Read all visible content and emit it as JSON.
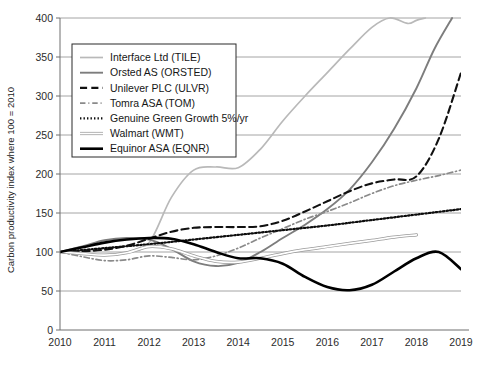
{
  "chart_data": {
    "type": "line",
    "title": "",
    "xlabel": "",
    "ylabel": "Carbon productivity index where 100 = 2010",
    "xlim": [
      2010,
      2019
    ],
    "ylim": [
      0,
      400
    ],
    "yticks": [
      0,
      50,
      100,
      150,
      200,
      250,
      300,
      350,
      400
    ],
    "xticks": [
      2010,
      2011,
      2012,
      2013,
      2014,
      2015,
      2016,
      2017,
      2018,
      2019
    ],
    "grid": true,
    "legend_position": "upper-left",
    "x": [
      2010,
      2011,
      2012,
      2013,
      2014,
      2015,
      2016,
      2017,
      2018,
      2019
    ],
    "series": [
      {
        "name": "Interface Ltd (TILE)",
        "color": "#b9b9b9",
        "style": "solid",
        "width": 1.7,
        "x": [
          2010,
          2010.5,
          2011,
          2011.5,
          2012,
          2012.5,
          2013,
          2013.5,
          2014,
          2014.5,
          2015,
          2015.5,
          2016,
          2016.5,
          2017,
          2017.4,
          2017.8,
          2018,
          2018.2
        ],
        "values": [
          100,
          98,
          96,
          99,
          112,
          170,
          205,
          209,
          208,
          232,
          268,
          300,
          330,
          360,
          388,
          400,
          393,
          397,
          400
        ]
      },
      {
        "name": "Orsted AS (ORSTED)",
        "color": "#7d7d7d",
        "style": "solid",
        "width": 1.9,
        "x": [
          2010,
          2010.5,
          2011,
          2011.5,
          2012,
          2012.5,
          2013,
          2013.5,
          2014,
          2014.5,
          2015,
          2015.5,
          2016,
          2016.5,
          2017,
          2017.5,
          2018,
          2018.4,
          2018.8
        ],
        "values": [
          100,
          107,
          115,
          118,
          116,
          104,
          88,
          82,
          86,
          100,
          118,
          135,
          155,
          180,
          215,
          258,
          310,
          360,
          400
        ]
      },
      {
        "name": "Unilever PLC (ULVR)",
        "color": "#111111",
        "style": "dashed",
        "width": 2.1,
        "x": [
          2010,
          2010.5,
          2011,
          2011.5,
          2012,
          2012.5,
          2013,
          2013.5,
          2014,
          2014.5,
          2015,
          2015.5,
          2016,
          2016.5,
          2017,
          2017.5,
          2018,
          2018.5,
          2019
        ],
        "values": [
          100,
          101,
          103,
          108,
          117,
          126,
          131,
          132,
          132,
          133,
          140,
          152,
          165,
          178,
          188,
          193,
          197,
          245,
          330
        ]
      },
      {
        "name": "Tomra ASA (TOM)",
        "color": "#8a8a8a",
        "style": "dashdot",
        "width": 1.7,
        "x": [
          2010,
          2010.5,
          2011,
          2011.5,
          2012,
          2012.5,
          2013,
          2013.5,
          2014,
          2014.5,
          2015,
          2015.5,
          2016,
          2016.5,
          2017,
          2017.5,
          2018,
          2018.5,
          2019
        ],
        "values": [
          100,
          94,
          89,
          90,
          95,
          93,
          90,
          95,
          105,
          118,
          130,
          142,
          152,
          163,
          175,
          185,
          192,
          198,
          205
        ]
      },
      {
        "name": "Genuine Green Growth 5%/yr",
        "color": "#0d0d0d",
        "style": "dotted",
        "width": 2.2,
        "x": [
          2010,
          2011,
          2012,
          2013,
          2014,
          2015,
          2016,
          2017,
          2018,
          2019
        ],
        "values": [
          100,
          105,
          110,
          116,
          122,
          128,
          134,
          141,
          148,
          155
        ]
      },
      {
        "name": "Walmart (WMT)",
        "color": "#cfcfcf",
        "style": "outline",
        "width": 3.2,
        "x": [
          2010,
          2010.5,
          2011,
          2011.5,
          2012,
          2012.5,
          2013,
          2013.5,
          2014,
          2014.5,
          2015,
          2015.5,
          2016,
          2016.5,
          2017,
          2017.5,
          2018
        ],
        "values": [
          100,
          98,
          96,
          99,
          107,
          104,
          95,
          88,
          87,
          92,
          98,
          103,
          107,
          111,
          115,
          119,
          122
        ]
      },
      {
        "name": "Equinor ASA (EQNR)",
        "color": "#000000",
        "style": "solid",
        "width": 2.6,
        "x": [
          2010,
          2010.5,
          2011,
          2011.5,
          2012,
          2012.5,
          2013,
          2013.5,
          2014,
          2014.5,
          2015,
          2015.5,
          2016,
          2016.5,
          2017,
          2017.5,
          2018,
          2018.5,
          2019
        ],
        "values": [
          100,
          106,
          112,
          116,
          118,
          117,
          110,
          100,
          92,
          92,
          85,
          68,
          55,
          51,
          58,
          75,
          92,
          100,
          78
        ]
      }
    ]
  },
  "legend": {
    "items": [
      {
        "label": "Interface Ltd (TILE)"
      },
      {
        "label": "Orsted AS (ORSTED)"
      },
      {
        "label": "Unilever PLC (ULVR)"
      },
      {
        "label": "Tomra ASA (TOM)"
      },
      {
        "label": "Genuine Green Growth 5%/yr"
      },
      {
        "label": "Walmart (WMT)"
      },
      {
        "label": "Equinor ASA (EQNR)"
      }
    ]
  }
}
